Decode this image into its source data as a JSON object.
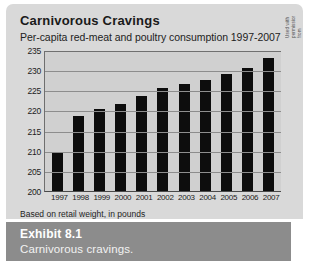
{
  "chart_data": {
    "type": "bar",
    "title": "Carnivorous Cravings",
    "subtitle": "Per-capita red-meat and poultry consumption 1997-2007",
    "xlabel": "",
    "ylabel": "",
    "ylim": [
      200,
      235
    ],
    "yticks": [
      235,
      230,
      225,
      220,
      215,
      210,
      205,
      200
    ],
    "grid": true,
    "legend": "none",
    "bar_color": "#0d0d0d",
    "plot_background": "#d0d0d0",
    "categories": [
      "1997",
      "1998",
      "1999",
      "2000",
      "2001",
      "2002",
      "2003",
      "2004",
      "2005",
      "2006",
      "2007"
    ],
    "values": [
      209.5,
      218.5,
      220.3,
      221.5,
      223.5,
      225.5,
      226.5,
      227.5,
      229.0,
      230.5,
      233.0
    ],
    "footnote": "Based on retail weight, in pounds"
  },
  "credit": {
    "text": "Used with permission from Restaurants USA, May 1998. © The National Restaurant Association. Source: U.S. Department of Agriculture."
  },
  "caption": {
    "label": "Exhibit 8.1",
    "text": "Carnivorous cravings."
  },
  "colors": {
    "card_background": "#d9d9d9",
    "caption_background": "#8c8c8c",
    "caption_text": "#ffffff",
    "gridline": "#8d8d8d",
    "axis": "#4a4a4a"
  }
}
